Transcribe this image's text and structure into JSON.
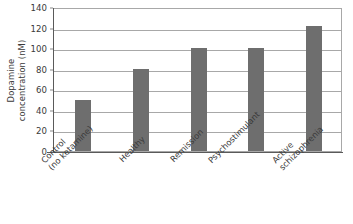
{
  "chart_data": {
    "type": "bar",
    "title": "",
    "subtitle": "",
    "xlabel": "",
    "ylabel": "Dopamine concentration (nM)",
    "ylabel_line1": "Dopamine",
    "ylabel_line2": "concentration (nM)",
    "categories": [
      "Control (no ketamine)",
      "Healthy",
      "Remission",
      "Psychostimulant",
      "Active schizophrenia"
    ],
    "category_lines": [
      [
        "Control",
        "(no ketamine)"
      ],
      [
        "Healthy"
      ],
      [
        "Remission"
      ],
      [
        "Psychostimulant"
      ],
      [
        "Active",
        "schizophrenia"
      ]
    ],
    "values": [
      50,
      80,
      100,
      100,
      122
    ],
    "ylim": [
      0,
      140
    ],
    "ytick_values": [
      0,
      20,
      40,
      60,
      80,
      100,
      120,
      140
    ],
    "ytick_labels": [
      "0",
      "20",
      "40",
      "60",
      "80",
      "100",
      "120",
      "140"
    ],
    "grid": true,
    "grid_orientation": "horizontal",
    "legend": false,
    "legend_position": "none",
    "bar_color": "#6e6e6e",
    "grid_color": "#a8a8a8",
    "axis_color": "#5a5a5a",
    "background_color": "#ffffff",
    "xtick_rotation": -45
  }
}
